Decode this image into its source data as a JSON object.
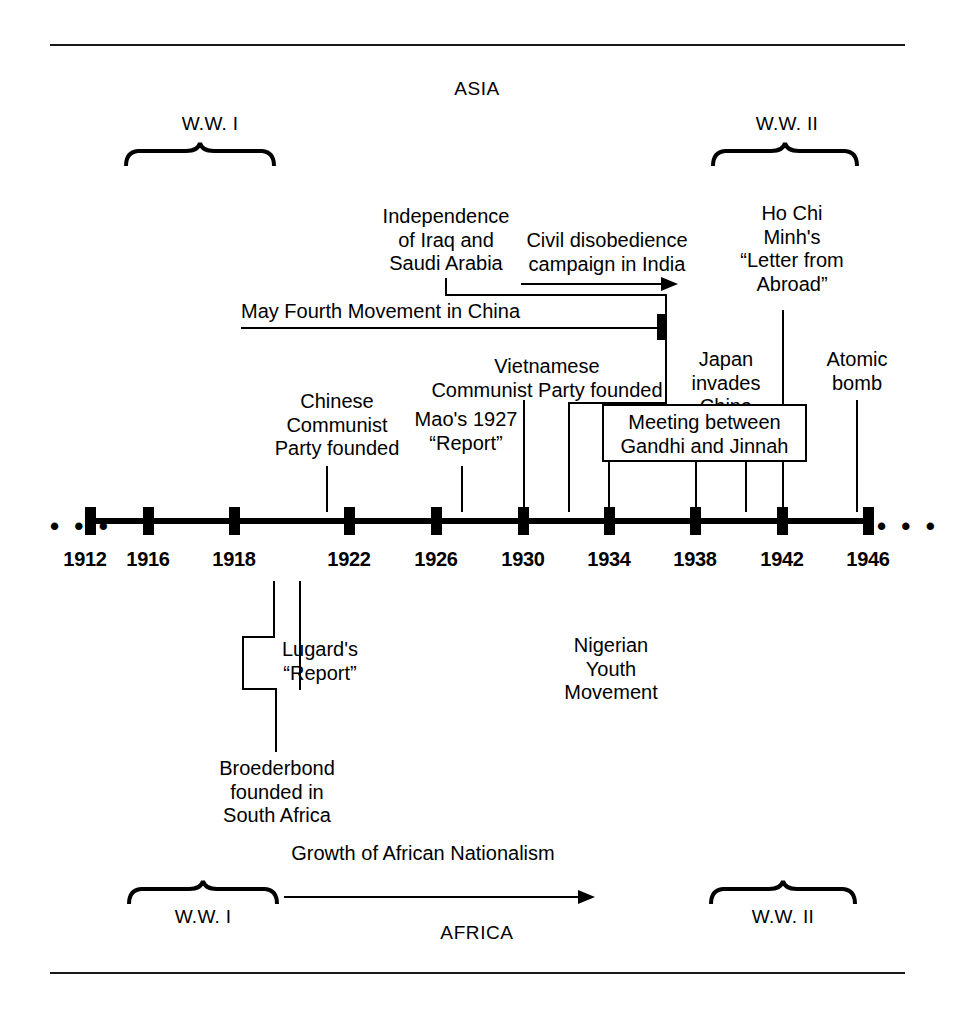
{
  "regions": {
    "top": "ASIA",
    "bottom": "AFRICA"
  },
  "wars": {
    "ww1_top": "W.W. I",
    "ww2_top": "W.W. II",
    "ww1_bottom": "W.W. I",
    "ww2_bottom": "W.W. II"
  },
  "timeline": {
    "years": [
      "1912",
      "1916",
      "1918",
      "1922",
      "1926",
      "1930",
      "1934",
      "1938",
      "1942",
      "1946"
    ],
    "leading_ellipsis": "• • •",
    "trailing_ellipsis": "• • •"
  },
  "asia_events": {
    "independence": "Independence\nof Iraq and\nSaudi Arabia",
    "civil_disobedience": "Civil disobedience\ncampaign in India",
    "ho_chi_minh": "Ho Chi\nMinh's\n“Letter from\nAbroad”",
    "may_fourth": "May Fourth Movement in China",
    "japan_invades": "Japan\ninvades\nChina",
    "atomic_bomb": "Atomic\nbomb",
    "chinese_cp": "Chinese\nCommunist\nParty founded",
    "mao_report": "Mao's 1927\n“Report”",
    "vietnamese_cp": "Vietnamese\nCommunist Party founded",
    "gandhi_jinnah": "Meeting between\nGandhi and Jinnah"
  },
  "africa_events": {
    "lugard": "Lugard's\n“Report”",
    "broederbond": "Broederbond\nfounded in\nSouth Africa",
    "nigerian_youth": "Nigerian\nYouth\nMovement",
    "african_nationalism": "Growth of African Nationalism"
  },
  "colors": {
    "ink": "#000000",
    "rule": "#1a1a1a",
    "background": "#ffffff"
  }
}
